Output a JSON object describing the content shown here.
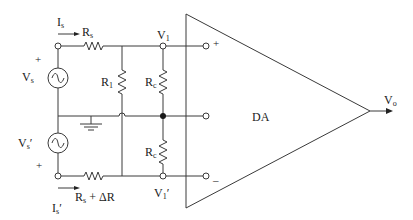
{
  "diagram": {
    "type": "circuit-schematic",
    "amplifier": {
      "label": "DA",
      "output_label": "Vo",
      "input_plus": "+",
      "input_minus": "–"
    },
    "sources": [
      {
        "name": "Vs",
        "label_main": "V",
        "label_sub": "s",
        "polarity": "+",
        "current_main": "I",
        "current_sub": "s",
        "resistor_main": "R",
        "resistor_sub": "s",
        "resistor_extra": ""
      },
      {
        "name": "Vs'",
        "label_main": "V",
        "label_sub": "s",
        "label_prime": "′",
        "polarity": "+",
        "current_main": "I",
        "current_sub": "s",
        "current_prime": "′",
        "resistor_main": "R",
        "resistor_sub": "s",
        "resistor_extra": " + ΔR"
      }
    ],
    "resistors": {
      "r1": {
        "main": "R",
        "sub": "1"
      },
      "rc_top": {
        "main": "R",
        "sub": "c"
      },
      "rc_bottom": {
        "main": "R",
        "sub": "c"
      }
    },
    "nodes": {
      "v1": {
        "main": "V",
        "sub": "1",
        "prime": ""
      },
      "v1p": {
        "main": "V",
        "sub": "1",
        "prime": "′"
      }
    },
    "ground": "ground-symbol"
  }
}
